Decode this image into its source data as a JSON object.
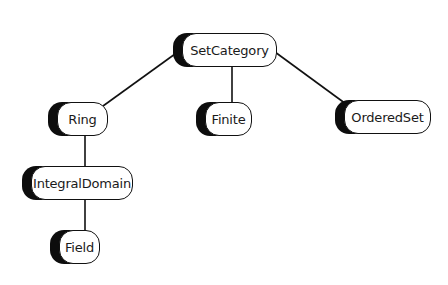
{
  "diagram": {
    "type": "hierarchy-tree",
    "colors": {
      "background": "#ffffff",
      "node_fill": "#ffffff",
      "node_border": "#111111",
      "node_shadow": "#0d0d0d",
      "edge": "#111111",
      "text": "#1a1a1a"
    },
    "nodes": [
      {
        "id": "setcategory",
        "label": "SetCategory",
        "x": 173,
        "y": 33,
        "w": 104
      },
      {
        "id": "ring",
        "label": "Ring",
        "x": 48,
        "y": 102,
        "w": 60
      },
      {
        "id": "finite",
        "label": "Finite",
        "x": 196,
        "y": 102,
        "w": 56
      },
      {
        "id": "orderedset",
        "label": "OrderedSet",
        "x": 335,
        "y": 100,
        "w": 96
      },
      {
        "id": "integraldomain",
        "label": "IntegralDomain",
        "x": 22,
        "y": 166,
        "w": 111
      },
      {
        "id": "field",
        "label": "Field",
        "x": 50,
        "y": 230,
        "w": 50
      }
    ],
    "edges": [
      {
        "from": "setcategory",
        "to": "ring",
        "x1": 175,
        "y1": 54,
        "x2": 103,
        "y2": 106
      },
      {
        "from": "setcategory",
        "to": "finite",
        "x1": 232,
        "y1": 66,
        "x2": 232,
        "y2": 102
      },
      {
        "from": "setcategory",
        "to": "orderedset",
        "x1": 275,
        "y1": 52,
        "x2": 346,
        "y2": 104
      },
      {
        "from": "ring",
        "to": "integraldomain",
        "x1": 85,
        "y1": 135,
        "x2": 85,
        "y2": 166
      },
      {
        "from": "integraldomain",
        "to": "field",
        "x1": 85,
        "y1": 200,
        "x2": 85,
        "y2": 230
      }
    ]
  }
}
